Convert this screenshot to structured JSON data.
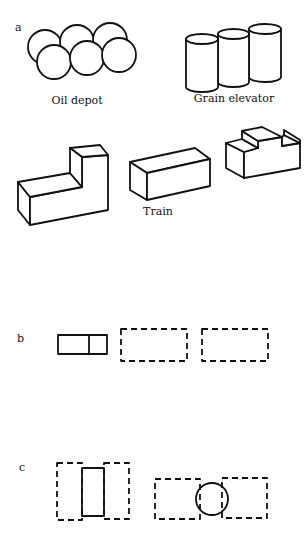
{
  "panels": {
    "a": {
      "label": "a",
      "captions": {
        "oil_depot": "Oil depot",
        "grain_elevator": "Grain elevator",
        "train": "Train"
      }
    },
    "b": {
      "label": "b"
    },
    "c": {
      "label": "c"
    }
  },
  "colors": {
    "stroke": "#111111",
    "background": "#ffffff"
  }
}
